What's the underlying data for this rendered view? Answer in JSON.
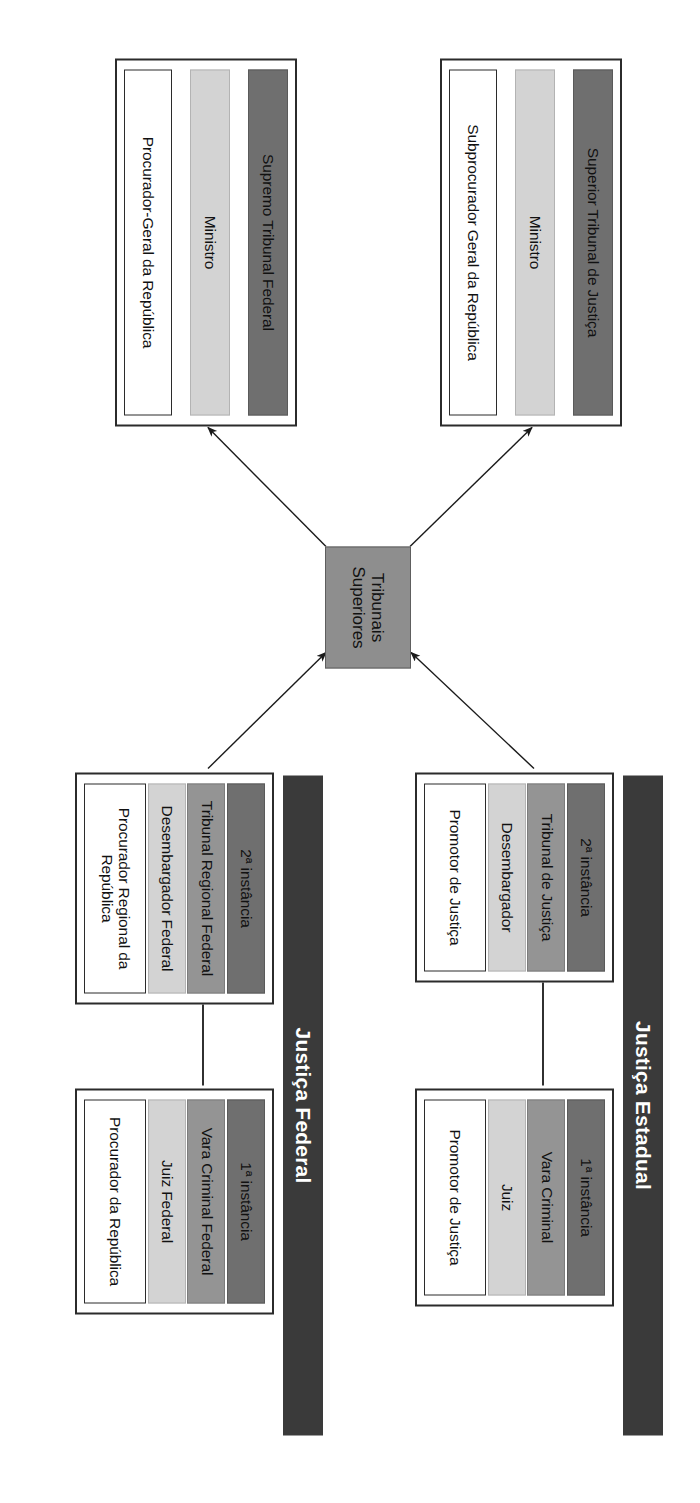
{
  "diagram": {
    "colors": {
      "level_bar": "#6f6f6f",
      "court_bar": "#949494",
      "judge_bar": "#d3d3d3",
      "prosecutor_bar": "#ffffff",
      "branch_label": "#3a3a3a",
      "center_box": "#8e8e8e",
      "outline": "#2b2b2b"
    },
    "branches": [
      {
        "id": "estadual",
        "label": "Justiça Estadual",
        "blocks": [
          {
            "id": "estadual-1a",
            "level": "1ª instância",
            "court": "Vara Criminal",
            "judge": "Juiz",
            "prosecutor": "Promotor de Justiça"
          },
          {
            "id": "estadual-2a",
            "level": "2ª instância",
            "court": "Tribunal de Justiça",
            "judge": "Desembargador",
            "prosecutor": "Promotor de Justiça"
          }
        ]
      },
      {
        "id": "federal",
        "label": "Justiça Federal",
        "blocks": [
          {
            "id": "federal-1a",
            "level": "1ª instância",
            "court": "Vara Criminal Federal",
            "judge": "Juiz Federal",
            "prosecutor": "Procurador da República"
          },
          {
            "id": "federal-2a",
            "level": "2ª instância",
            "court": "Tribunal Regional Federal",
            "judge": "Desembargador Federal",
            "prosecutor": "Procurador Regional da República"
          }
        ]
      }
    ],
    "center": {
      "id": "tribunais-superiores",
      "label": "Tribunais Superiores"
    },
    "superior_courts": [
      {
        "id": "stj",
        "court_name": "Superior Tribunal de Justiça",
        "judge": "Ministro",
        "prosecutor": "Subprocurador Geral da República"
      },
      {
        "id": "stf",
        "court_name": "Supremo Tribunal Federal",
        "judge": "Ministro",
        "prosecutor": "Procurador-Geral da República"
      }
    ]
  }
}
